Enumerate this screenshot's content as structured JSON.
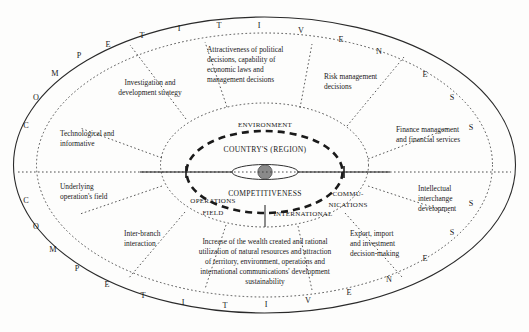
{
  "diagram": {
    "core": {
      "top_label": "COUNTRY'S (REGION)",
      "bottom_label": "COMPETITIVENESS",
      "nucleus_color": "#8a8a8a"
    },
    "middle_ring_labels": {
      "environment": "ENVIRONMENT",
      "operations_field_line1": "OPERATIONS",
      "operations_field_line2": "FIELD",
      "communications_line1": "COMMU-",
      "communications_line2": "NICATIONS",
      "international": "INTERNATIONAL"
    },
    "outer_ring_word": "COMPETITIVENESS",
    "outer_ring_letters": [
      {
        "char": "C",
        "x": 26,
        "y": 125
      },
      {
        "char": "O",
        "x": 36,
        "y": 97
      },
      {
        "char": "M",
        "x": 54,
        "y": 73
      },
      {
        "char": "P",
        "x": 78,
        "y": 55
      },
      {
        "char": "E",
        "x": 107,
        "y": 44
      },
      {
        "char": "T",
        "x": 141,
        "y": 35
      },
      {
        "char": "I",
        "x": 178,
        "y": 28
      },
      {
        "char": "T",
        "x": 218,
        "y": 25
      },
      {
        "char": "I",
        "x": 258,
        "y": 25
      },
      {
        "char": "V",
        "x": 300,
        "y": 30
      },
      {
        "char": "E",
        "x": 340,
        "y": 39
      },
      {
        "char": "N",
        "x": 378,
        "y": 51
      },
      {
        "char": "E",
        "x": 424,
        "y": 74
      },
      {
        "char": "S",
        "x": 451,
        "y": 97
      },
      {
        "char": "S",
        "x": 470,
        "y": 127
      },
      {
        "char": "S",
        "x": 470,
        "y": 203
      },
      {
        "char": "S",
        "x": 451,
        "y": 232
      },
      {
        "char": "E",
        "x": 424,
        "y": 258
      },
      {
        "char": "N",
        "x": 388,
        "y": 279
      },
      {
        "char": "E",
        "x": 348,
        "y": 292
      },
      {
        "char": "V",
        "x": 307,
        "y": 300
      },
      {
        "char": "I",
        "x": 265,
        "y": 304
      },
      {
        "char": "T",
        "x": 224,
        "y": 305
      },
      {
        "char": "I",
        "x": 182,
        "y": 302
      },
      {
        "char": "T",
        "x": 142,
        "y": 295
      },
      {
        "char": "E",
        "x": 106,
        "y": 284
      },
      {
        "char": "P",
        "x": 76,
        "y": 268
      },
      {
        "char": "M",
        "x": 52,
        "y": 249
      },
      {
        "char": "O",
        "x": 35,
        "y": 226
      },
      {
        "char": "C",
        "x": 26,
        "y": 200
      }
    ],
    "sectors": [
      {
        "id": "investigation-development",
        "name": "Investigation and development strategy",
        "lines": [
          "Investigation and",
          "development strategy"
        ],
        "x": 150,
        "y": 85,
        "anchor": "middle"
      },
      {
        "id": "attractiveness-political",
        "name": "Attractiveness of political decisions, capability of economic laws and management decisions",
        "lines": [
          "Attractiveness of political",
          "decisions, capability of",
          "economic laws and",
          "management decisions"
        ],
        "x": 210,
        "y": 55,
        "anchor": "start"
      },
      {
        "id": "risk-management",
        "name": "Risk management decisions",
        "lines": [
          "Risk management",
          "decisions"
        ],
        "x": 325,
        "y": 76,
        "anchor": "start"
      },
      {
        "id": "finance-management",
        "name": "Finance management and financial services",
        "lines": [
          "Finance management",
          "and financial services"
        ],
        "x": 398,
        "y": 134,
        "anchor": "start"
      },
      {
        "id": "intellectual-interchange",
        "name": "Intellectual interchange development",
        "lines": [
          "Intellectual",
          "interchange",
          "development"
        ],
        "x": 418,
        "y": 192,
        "anchor": "start"
      },
      {
        "id": "export-import-investment",
        "name": "Export, import and investment decision-making",
        "lines": [
          "Export, import",
          "and investment",
          "decision-making"
        ],
        "x": 352,
        "y": 238,
        "anchor": "start"
      },
      {
        "id": "wealth-sustainability",
        "name": "Increase of the wealth created and rational utilization of natural resources and attraction of territory, environment, operations and international communications' development sustainability",
        "lines": [
          "Increase of the wealth created and rational",
          "utilization of natural resources and attraction",
          "of territory, environment, operations and",
          "international communications' development",
          "sustainability"
        ],
        "x": 265,
        "y": 244,
        "anchor": "middle"
      },
      {
        "id": "inter-branch-interaction",
        "name": "Inter-branch interaction",
        "lines": [
          "Inter-branch",
          "interaction"
        ],
        "x": 125,
        "y": 232,
        "anchor": "start"
      },
      {
        "id": "underlying-operations-field",
        "name": "Underlying operation's field",
        "lines": [
          "Underlying",
          "operation's field"
        ],
        "x": 62,
        "y": 186,
        "anchor": "start"
      },
      {
        "id": "technological-informative",
        "name": "Technological and informative",
        "lines": [
          "Technological and",
          "informative"
        ],
        "x": 62,
        "y": 133,
        "anchor": "start"
      }
    ]
  }
}
